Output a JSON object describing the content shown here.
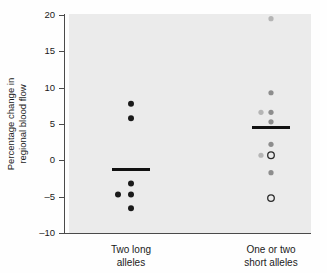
{
  "chart_data": {
    "type": "scatter",
    "title": "",
    "subtitle": "",
    "xlabel": "",
    "ylabel": "Percentage change in regional blood flow",
    "ylabel_lines": [
      "Percentage change in",
      "regional blood flow"
    ],
    "ylim": [
      -10,
      20
    ],
    "yticks": [
      20,
      15,
      10,
      5,
      0,
      -5,
      -10
    ],
    "ytick_labels": [
      "20",
      "15",
      "10",
      "5",
      "0",
      "-5",
      "-10"
    ],
    "grid": false,
    "legend": "none",
    "categories": [
      "Two long alleles",
      "One or two short alleles"
    ],
    "category_label_lines": [
      [
        "Two long",
        "alleles"
      ],
      [
        "One or two",
        "short alleles"
      ]
    ],
    "series": [
      {
        "name": "Two long alleles",
        "category_index": 0,
        "mean": -1.3,
        "points": [
          {
            "value": 7.8,
            "marker": "filled",
            "shade": "dark",
            "offset": 0
          },
          {
            "value": 5.8,
            "marker": "filled",
            "shade": "dark",
            "offset": 0
          },
          {
            "value": -3.2,
            "marker": "filled",
            "shade": "dark",
            "offset": 0
          },
          {
            "value": -4.7,
            "marker": "filled",
            "shade": "dark",
            "offset": -13
          },
          {
            "value": -4.7,
            "marker": "filled",
            "shade": "dark",
            "offset": 0
          },
          {
            "value": -6.6,
            "marker": "filled",
            "shade": "dark",
            "offset": 0
          }
        ]
      },
      {
        "name": "One or two short alleles",
        "category_index": 1,
        "mean": 4.5,
        "points": [
          {
            "value": 19.5,
            "marker": "filled",
            "shade": "light",
            "offset": 0
          },
          {
            "value": 9.3,
            "marker": "filled",
            "shade": "mid",
            "offset": 0
          },
          {
            "value": 6.6,
            "marker": "filled",
            "shade": "light",
            "offset": -10
          },
          {
            "value": 6.6,
            "marker": "filled",
            "shade": "mid",
            "offset": 0
          },
          {
            "value": 5.3,
            "marker": "filled",
            "shade": "mid",
            "offset": 0
          },
          {
            "value": 2.2,
            "marker": "filled",
            "shade": "mid",
            "offset": 0
          },
          {
            "value": 0.7,
            "marker": "filled",
            "shade": "light",
            "offset": -10
          },
          {
            "value": 0.7,
            "marker": "open",
            "shade": "dark",
            "offset": 0
          },
          {
            "value": -1.7,
            "marker": "filled",
            "shade": "mid",
            "offset": 0
          },
          {
            "value": -5.2,
            "marker": "open",
            "shade": "dark",
            "offset": 0
          }
        ]
      }
    ]
  },
  "figure": {
    "background_color": "#fefefe",
    "plot_area_color": "#ebebeb",
    "axis_color": "#4a4a4a",
    "mean_line_color": "#111111",
    "point_color_dark": "#1a1a1a",
    "point_color_mid": "#8d8d8d",
    "point_color_light": "#b5b5b5",
    "footer_rule_color": "#6e6e6e"
  }
}
